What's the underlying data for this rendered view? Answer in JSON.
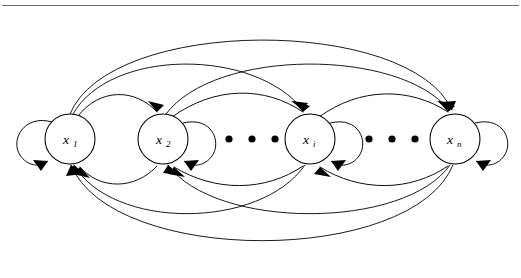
{
  "figure": {
    "type": "directed-graph-diagram",
    "title": "",
    "background_color": "#ffffff",
    "line_color": "#000000",
    "rule_color": "#6e6e6e",
    "width": 521,
    "height": 278,
    "has_top_rule": true
  },
  "nodes": [
    {
      "id": "x1",
      "base": "x",
      "subscript": "1",
      "label": "x1",
      "cx": 70,
      "cy": 139,
      "r": 25,
      "self_loop_side": "left"
    },
    {
      "id": "x2",
      "base": "x",
      "subscript": "2",
      "label": "x2",
      "cx": 163,
      "cy": 139,
      "r": 25,
      "self_loop_side": "right"
    },
    {
      "id": "xi",
      "base": "x",
      "subscript": "i",
      "label": "xi",
      "cx": 310,
      "cy": 139,
      "r": 25,
      "self_loop_side": "right"
    },
    {
      "id": "xn",
      "base": "x",
      "subscript": "n",
      "label": "xn",
      "cx": 455,
      "cy": 139,
      "r": 25,
      "self_loop_side": "right"
    }
  ],
  "ellipses": [
    {
      "name": "ellipsis-between-x2-xi",
      "dots": 3,
      "cx": [
        229,
        252,
        275
      ],
      "cy": 139,
      "r": 3.6
    },
    {
      "name": "ellipsis-between-xi-xn",
      "dots": 3,
      "cx": [
        369,
        392,
        415
      ],
      "cy": 139,
      "r": 3.6
    }
  ],
  "edges": {
    "forward": [
      {
        "from": "x1",
        "to": "x2",
        "side": "top",
        "name": "edge-x1-x2"
      },
      {
        "from": "x1",
        "to": "xi",
        "side": "top",
        "name": "edge-x1-xi"
      },
      {
        "from": "x1",
        "to": "xn",
        "side": "top",
        "name": "edge-x1-xn"
      },
      {
        "from": "x2",
        "to": "xi",
        "side": "top",
        "name": "edge-x2-xi"
      },
      {
        "from": "x2",
        "to": "xn",
        "side": "top",
        "name": "edge-x2-xn"
      },
      {
        "from": "xi",
        "to": "xn",
        "side": "top",
        "name": "edge-xi-xn"
      }
    ],
    "backward": [
      {
        "from": "x2",
        "to": "x1",
        "side": "bottom",
        "name": "edge-x2-x1"
      },
      {
        "from": "xi",
        "to": "x1",
        "side": "bottom",
        "name": "edge-xi-x1"
      },
      {
        "from": "xn",
        "to": "x1",
        "side": "bottom",
        "name": "edge-xn-x1"
      },
      {
        "from": "xi",
        "to": "x2",
        "side": "bottom",
        "name": "edge-xi-x2"
      },
      {
        "from": "xn",
        "to": "x2",
        "side": "bottom",
        "name": "edge-xn-x2"
      },
      {
        "from": "xn",
        "to": "xi",
        "side": "bottom",
        "name": "edge-xn-xi"
      }
    ],
    "self_loops": [
      {
        "node": "x1",
        "name": "selfloop-x1"
      },
      {
        "node": "x2",
        "name": "selfloop-x2"
      },
      {
        "node": "xi",
        "name": "selfloop-xi"
      },
      {
        "node": "xn",
        "name": "selfloop-xn"
      }
    ]
  }
}
